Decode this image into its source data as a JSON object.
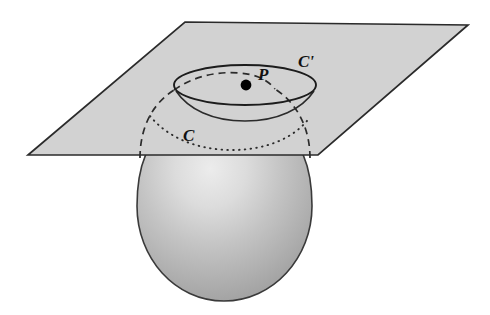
{
  "figure": {
    "background_color": "#ffffff"
  },
  "labels": {
    "point_p": "P",
    "curve_c": "C",
    "curve_c_prime": "C'"
  },
  "colors": {
    "plane_fill": "#d2d2d2",
    "plane_stroke": "#2b2b2b",
    "sphere_light": "#e8e8e8",
    "sphere_mid": "#bdbdbd",
    "sphere_dark": "#9a9a9a",
    "outline": "#333333",
    "point_fill": "#000000",
    "label_color": "#111111"
  },
  "geometry": {
    "plane": {
      "name": "cutting-plane",
      "points": "185,22 468,25 318,155 28,155"
    },
    "sphere": {
      "name": "sphere-body",
      "center_x": 224,
      "center_y": 215,
      "radius_x": 88,
      "radius_y": 88,
      "top_y": 145,
      "bottom_y": 301,
      "left_x": 137,
      "right_x": 312
    },
    "ellipse_c_prime": {
      "name": "circle-c-prime",
      "cx": 245,
      "cy": 85,
      "rx": 71,
      "ry": 20
    },
    "point_p": {
      "name": "point-p",
      "cx": 246,
      "cy": 85,
      "r": 5.4
    },
    "label_positions": {
      "p": {
        "x": 258,
        "y": 79
      },
      "c": {
        "x": 183,
        "y": 140
      },
      "c_prime": {
        "x": 299,
        "y": 66
      }
    },
    "curve_c_dotted": {
      "name": "circle-c-dotted",
      "path": "M 148,117 C 172,141 205,150 233,150 C 262,150 288,141 304,119"
    },
    "curve_c_front_solid": {
      "name": "sphere-front-arc",
      "path": "M 174,90 C 186,108 210,120 244,120 C 278,120 302,108 314,90"
    },
    "sphere_hidden_left": {
      "name": "sphere-hidden-outline-left",
      "path": "M 137,162 C 137,130 155,100 186,86"
    },
    "sphere_hidden_right": {
      "name": "sphere-hidden-outline-right",
      "path": "M 312,162 C 312,130 294,100 263,86"
    },
    "sphere_hidden_cap": {
      "name": "sphere-hidden-cap-arc",
      "path": "M 186,86 C 204,78 226,74 246,74 C 252,74 258,75 263,86"
    }
  }
}
